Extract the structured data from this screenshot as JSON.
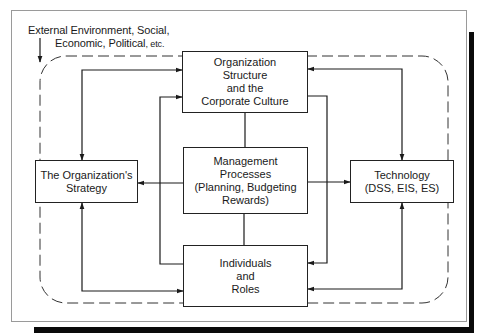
{
  "diagram": {
    "environment_label": {
      "line1": "External Environment, Social,",
      "line2": "Economic, Political",
      "line2_suffix": ", etc."
    },
    "nodes": [
      {
        "id": "structure",
        "lines": [
          "Organization",
          "Structure",
          "and the",
          "Corporate Culture"
        ]
      },
      {
        "id": "strategy",
        "lines": [
          "The Organization's",
          "Strategy"
        ]
      },
      {
        "id": "management",
        "lines": [
          "Management",
          "Processes",
          "(Planning, Budgeting",
          "Rewards)"
        ]
      },
      {
        "id": "technology",
        "lines": [
          "Technology",
          "(DSS, EIS, ES)"
        ]
      },
      {
        "id": "individuals",
        "lines": [
          "Individuals",
          "and",
          "Roles"
        ]
      }
    ],
    "edges": [
      {
        "from": "structure",
        "to": "strategy",
        "bidirectional": true
      },
      {
        "from": "structure",
        "to": "technology",
        "bidirectional": true
      },
      {
        "from": "strategy",
        "to": "individuals",
        "bidirectional": true
      },
      {
        "from": "technology",
        "to": "individuals",
        "bidirectional": true
      },
      {
        "from": "management",
        "to": "strategy",
        "bidirectional": false
      },
      {
        "from": "management",
        "to": "technology",
        "bidirectional": false
      },
      {
        "from": "structure",
        "to": "management",
        "bidirectional": false
      },
      {
        "from": "management",
        "to": "individuals",
        "bidirectional": false
      },
      {
        "from": "individuals",
        "to": "structure",
        "via": "left inner loop"
      },
      {
        "from": "structure",
        "to": "individuals",
        "via": "right inner loop"
      }
    ],
    "boundary": {
      "style": "dashed rounded rectangle",
      "meaning": "External Environment"
    }
  },
  "colors": {
    "line": "#1a1a1a",
    "frame": "#9a9a9a",
    "shadow": "#0a0a0a",
    "background": "#ffffff"
  }
}
